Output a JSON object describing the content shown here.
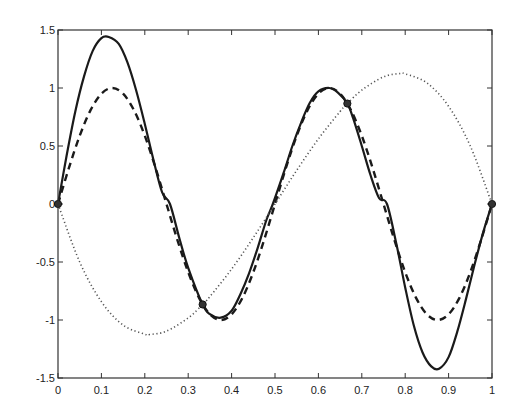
{
  "chart_data": {
    "type": "line",
    "title": "",
    "xlabel": "",
    "ylabel": "",
    "xlim": [
      0,
      1
    ],
    "ylim": [
      -1.5,
      1.5
    ],
    "grid": false,
    "legend": null,
    "x_ticks": [
      "0",
      "0.1",
      "0.2",
      "0.3",
      "0.4",
      "0.5",
      "0.6",
      "0.7",
      "0.8",
      "0.9",
      "1"
    ],
    "y_ticks": [
      "-1.5",
      "-1",
      "-0.5",
      "0",
      "0.5",
      "1",
      "1.5"
    ],
    "series": [
      {
        "name": "solid",
        "style": "solid",
        "color": "#1a1a1a",
        "x": [
          0,
          0.02,
          0.04,
          0.06,
          0.08,
          0.1,
          0.117,
          0.14,
          0.16,
          0.18,
          0.2,
          0.22,
          0.24,
          0.258,
          0.28,
          0.3,
          0.3333,
          0.35,
          0.375,
          0.4,
          0.42,
          0.44,
          0.46,
          0.48,
          0.495,
          0.52,
          0.54,
          0.56,
          0.58,
          0.6,
          0.625,
          0.645,
          0.6667,
          0.68,
          0.7,
          0.72,
          0.74,
          0.758,
          0.78,
          0.8,
          0.82,
          0.84,
          0.86,
          0.878,
          0.9,
          0.92,
          0.94,
          0.96,
          0.98,
          1
        ],
        "y": [
          0,
          0.42,
          0.8,
          1.1,
          1.32,
          1.43,
          1.44,
          1.38,
          1.22,
          0.98,
          0.69,
          0.38,
          0.1,
          0,
          -0.3,
          -0.55,
          -0.866,
          -0.95,
          -0.98,
          -0.92,
          -0.78,
          -0.6,
          -0.38,
          -0.14,
          0,
          0.27,
          0.5,
          0.7,
          0.87,
          0.97,
          1.0,
          0.96,
          0.866,
          0.74,
          0.5,
          0.25,
          0.05,
          0,
          -0.35,
          -0.72,
          -1.05,
          -1.28,
          -1.4,
          -1.42,
          -1.32,
          -1.1,
          -0.82,
          -0.52,
          -0.24,
          0
        ]
      },
      {
        "name": "dashed",
        "style": "dashed",
        "color": "#1a1a1a",
        "function": "sin(4*pi*x)",
        "x": [
          0,
          0.025,
          0.05,
          0.075,
          0.1,
          0.125,
          0.15,
          0.175,
          0.2,
          0.225,
          0.25,
          0.275,
          0.3,
          0.325,
          0.35,
          0.375,
          0.4,
          0.425,
          0.45,
          0.475,
          0.5,
          0.525,
          0.55,
          0.575,
          0.6,
          0.625,
          0.65,
          0.675,
          0.7,
          0.725,
          0.75,
          0.775,
          0.8,
          0.825,
          0.85,
          0.875,
          0.9,
          0.925,
          0.95,
          0.975,
          1
        ],
        "y": [
          0,
          0.309,
          0.588,
          0.809,
          0.951,
          1.0,
          0.951,
          0.809,
          0.588,
          0.309,
          0,
          -0.309,
          -0.588,
          -0.809,
          -0.951,
          -1.0,
          -0.951,
          -0.809,
          -0.588,
          -0.309,
          0,
          0.309,
          0.588,
          0.809,
          0.951,
          1.0,
          0.951,
          0.809,
          0.588,
          0.309,
          0,
          -0.309,
          -0.588,
          -0.809,
          -0.951,
          -1.0,
          -0.951,
          -0.809,
          -0.588,
          -0.309,
          0
        ]
      },
      {
        "name": "dotted",
        "style": "dotted",
        "color": "#555555",
        "function": "cubic interpolant through nodes 0, 1/3, 2/3, 1",
        "x": [
          0,
          0.05,
          0.1,
          0.15,
          0.2,
          0.2113,
          0.25,
          0.3,
          0.3333,
          0.35,
          0.4,
          0.45,
          0.5,
          0.55,
          0.6,
          0.65,
          0.6667,
          0.7,
          0.75,
          0.7887,
          0.8,
          0.85,
          0.9,
          0.95,
          1
        ],
        "y": [
          0,
          -0.5,
          -0.842,
          -1.044,
          -1.122,
          -1.125,
          -1.096,
          -0.982,
          -0.866,
          -0.798,
          -0.561,
          -0.29,
          0,
          0.29,
          0.561,
          0.798,
          0.866,
          0.982,
          1.096,
          1.125,
          1.122,
          1.044,
          0.842,
          0.5,
          0
        ]
      }
    ],
    "markers": {
      "style": "circle",
      "x": [
        0,
        0.3333,
        0.6667,
        1
      ],
      "y": [
        0,
        -0.866,
        0.866,
        0
      ]
    }
  }
}
